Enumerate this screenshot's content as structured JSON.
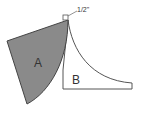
{
  "diagram": {
    "labels": {
      "a": "A",
      "b": "B",
      "dimension": "1/2\""
    },
    "colors": {
      "shape_a_fill": "#8a8a8a",
      "stroke": "#444444",
      "background": "#ffffff"
    }
  }
}
